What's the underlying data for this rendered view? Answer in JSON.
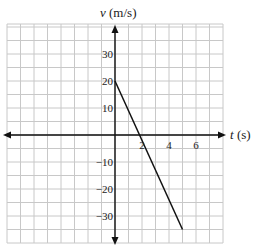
{
  "chart_data": {
    "type": "line",
    "title": "",
    "xlabel": "t (s)",
    "ylabel": "v (m/s)",
    "xlabel_var": "t",
    "xlabel_unit": "(s)",
    "ylabel_var": "v",
    "ylabel_unit": "(m/s)",
    "x_ticks": [
      2,
      4,
      6
    ],
    "x_tick_labels": [
      "2",
      "4",
      "6"
    ],
    "y_ticks": [
      30,
      20,
      10,
      -10,
      -20,
      -30
    ],
    "y_tick_labels": [
      "30",
      "20",
      "10",
      "−10",
      "−20",
      "−30"
    ],
    "xlim": [
      -8,
      8
    ],
    "ylim": [
      -40,
      40
    ],
    "grid": true,
    "grid_x_step": 1,
    "grid_y_step": 5,
    "series": [
      {
        "name": "velocity",
        "x": [
          0,
          5
        ],
        "y": [
          20,
          -35
        ]
      }
    ],
    "colors": {
      "grid": "#c8c8c8",
      "axis": "#111111",
      "line": "#111111"
    }
  }
}
